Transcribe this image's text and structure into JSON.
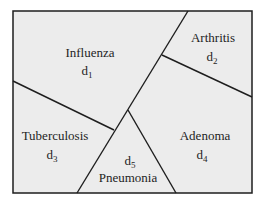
{
  "diagram": {
    "type": "voronoi-partition",
    "background": "#ececec",
    "line_color": "#1e1e1e",
    "regions": [
      {
        "name": "Influenza",
        "symbol": "d",
        "index": "1"
      },
      {
        "name": "Arthritis",
        "symbol": "d",
        "index": "2"
      },
      {
        "name": "Tuberculosis",
        "symbol": "d",
        "index": "3"
      },
      {
        "name": "Adenoma",
        "symbol": "d",
        "index": "4"
      },
      {
        "name": "Pneumonia",
        "symbol": "d",
        "index": "5"
      }
    ]
  }
}
